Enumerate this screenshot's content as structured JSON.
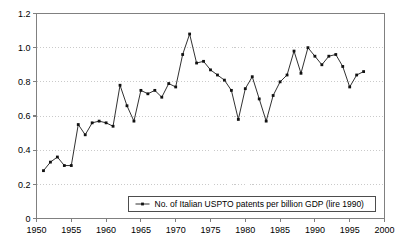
{
  "chart_data": {
    "type": "line",
    "title": "",
    "subtitle": "",
    "xlabel": "",
    "ylabel": "",
    "xlim": [
      1950,
      2000
    ],
    "ylim": [
      0,
      1.2
    ],
    "grid": true,
    "legend_position": "bottom-center",
    "legend": [
      "No. of Italian USPTO patents per billion GDP (lire 1990)"
    ],
    "marker": "filled-square",
    "x_tick_labels": [
      "1950",
      "1955",
      "1960",
      "1965",
      "1970",
      "1975",
      "1980",
      "1985",
      "1990",
      "1995",
      "2000"
    ],
    "x_ticks": [
      1950,
      1955,
      1960,
      1965,
      1970,
      1975,
      1980,
      1985,
      1990,
      1995,
      2000
    ],
    "y_tick_labels": [
      "0",
      "0.2",
      "0.4",
      "0.6",
      "0.8",
      "1.0",
      "1.2"
    ],
    "y_ticks": [
      0,
      0.2,
      0.4,
      0.6,
      0.8,
      1.0,
      1.2
    ],
    "x": [
      1951,
      1952,
      1953,
      1954,
      1955,
      1956,
      1957,
      1958,
      1959,
      1960,
      1961,
      1962,
      1963,
      1964,
      1965,
      1966,
      1967,
      1968,
      1969,
      1970,
      1971,
      1972,
      1973,
      1974,
      1975,
      1976,
      1977,
      1978,
      1979,
      1980,
      1981,
      1982,
      1983,
      1984,
      1985,
      1986,
      1987,
      1988,
      1989,
      1990,
      1991,
      1992,
      1993,
      1994,
      1995,
      1996,
      1997
    ],
    "series": [
      {
        "name": "No. of Italian USPTO patents per billion GDP (lire 1990)",
        "color": "#1a1a1a",
        "values": [
          0.28,
          0.33,
          0.36,
          0.31,
          0.31,
          0.55,
          0.49,
          0.56,
          0.57,
          0.56,
          0.54,
          0.78,
          0.66,
          0.57,
          0.75,
          0.73,
          0.75,
          0.71,
          0.79,
          0.77,
          0.96,
          1.08,
          0.91,
          0.92,
          0.87,
          0.84,
          0.81,
          0.75,
          0.58,
          0.76,
          0.83,
          0.7,
          0.57,
          0.72,
          0.8,
          0.84,
          0.98,
          0.85,
          1.0,
          0.95,
          0.9,
          0.95,
          0.96,
          0.89,
          0.77,
          0.84,
          0.86
        ]
      }
    ]
  }
}
